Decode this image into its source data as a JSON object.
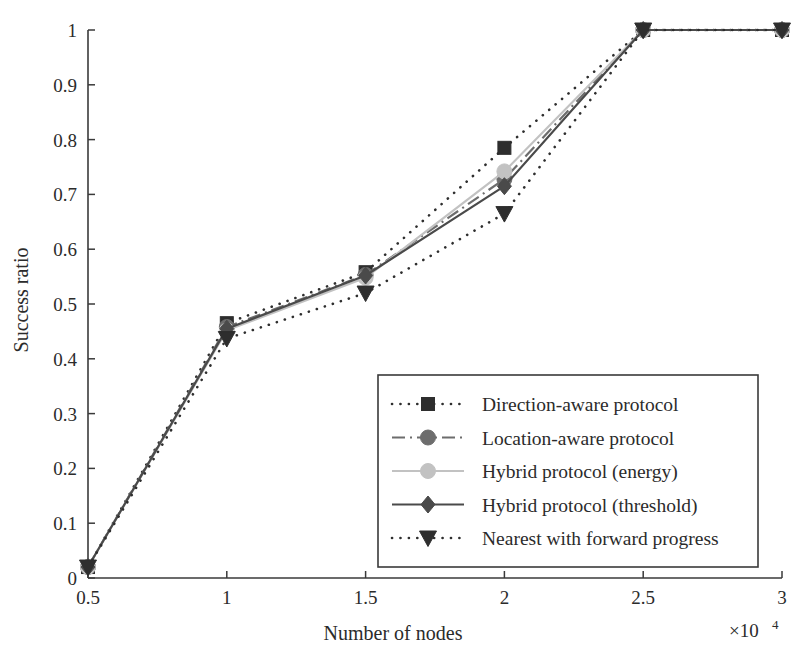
{
  "chart_data": {
    "type": "line",
    "title": "",
    "xlabel": "Number of nodes",
    "ylabel": "Success ratio",
    "x_multiplier": "×10",
    "x_multiplier_exp": "4",
    "x": [
      0.5,
      1,
      1.5,
      2,
      2.5,
      3
    ],
    "xlim": [
      0.5,
      3
    ],
    "ylim": [
      0,
      1
    ],
    "xticks": [
      "0.5",
      "1",
      "1.5",
      "2",
      "2.5",
      "3"
    ],
    "yticks": [
      "0",
      "0.1",
      "0.2",
      "0.3",
      "0.4",
      "0.5",
      "0.6",
      "0.7",
      "0.8",
      "0.9",
      "1"
    ],
    "grid": false,
    "legend_position": "center-right-lower",
    "series": [
      {
        "name": "Direction-aware protocol",
        "values": [
          0.02,
          0.465,
          0.558,
          0.785,
          1.0,
          1.0
        ],
        "marker": "square",
        "color": "#2e2e2e",
        "linestyle": "dotted"
      },
      {
        "name": "Location-aware protocol",
        "values": [
          0.02,
          0.458,
          0.553,
          0.728,
          1.0,
          1.0
        ],
        "marker": "circle",
        "color": "#6d6d6d",
        "linestyle": "dashdot"
      },
      {
        "name": "Hybrid protocol (energy)",
        "values": [
          0.02,
          0.452,
          0.548,
          0.742,
          1.0,
          1.0
        ],
        "marker": "circle",
        "color": "#c2c2c2",
        "linestyle": "solid"
      },
      {
        "name": "Hybrid protocol (threshold)",
        "values": [
          0.02,
          0.455,
          0.552,
          0.715,
          1.0,
          1.0
        ],
        "marker": "diamond",
        "color": "#4a4a4a",
        "linestyle": "solid"
      },
      {
        "name": "Nearest with forward progress",
        "values": [
          0.02,
          0.437,
          0.52,
          0.665,
          1.0,
          1.0
        ],
        "marker": "triangle-down",
        "color": "#2e2e2e",
        "linestyle": "dotted"
      }
    ]
  }
}
